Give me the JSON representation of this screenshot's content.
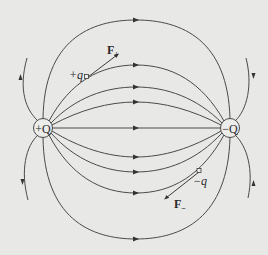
{
  "diagram": {
    "colors": {
      "background": "#e8e8e7",
      "line": "#4a4a4a",
      "text": "#2a2a2a"
    },
    "charges": [
      {
        "id": "positive-source",
        "label": "+Q",
        "x": 43,
        "y": 128
      },
      {
        "id": "negative-source",
        "label": "−Q",
        "x": 230,
        "y": 128
      }
    ],
    "test_charges": [
      {
        "id": "positive-test",
        "label": "+q",
        "force_label": "F",
        "force_sub": "+"
      },
      {
        "id": "negative-test",
        "label": "−q",
        "force_label": "F",
        "force_sub": "−"
      }
    ],
    "field_line_count": 13,
    "arrow_direction": "from +Q to −Q"
  }
}
